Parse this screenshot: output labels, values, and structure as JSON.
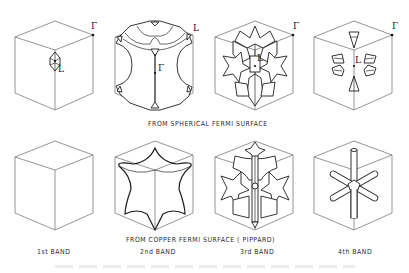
{
  "figure": {
    "rows": [
      {
        "id": "spherical",
        "caption": "FROM SPHERICAL FERMI SURFACE",
        "panels": [
          {
            "band": "1st",
            "shape": "small lens pocket at L",
            "point_labels": [
              "Γ",
              "L"
            ]
          },
          {
            "band": "2nd",
            "shape": "large surface with necks toward L",
            "point_labels": [
              "L",
              "Γ"
            ]
          },
          {
            "band": "3rd",
            "shape": "complex multi-lobed surface",
            "point_labels": [
              "Γ",
              "L"
            ]
          },
          {
            "band": "4th",
            "shape": "six small pockets around L",
            "point_labels": [
              "Γ",
              "L"
            ]
          }
        ]
      },
      {
        "id": "copper",
        "caption": "FROM COPPER FERMI SURFACE ( PIPPARD)",
        "panels": [
          {
            "band": "1st",
            "shape": "empty zone"
          },
          {
            "band": "2nd",
            "shape": "six-pointed star surface"
          },
          {
            "band": "3rd",
            "shape": "multi-lobed surface"
          },
          {
            "band": "4th",
            "shape": "six-armed tubular network"
          }
        ]
      }
    ],
    "band_labels": [
      "1st BAND",
      "2nd BAND",
      "3rd BAND",
      "4th BAND"
    ],
    "symbols": {
      "gamma": "Γ",
      "L": "L"
    },
    "colors": {
      "line": "#1e1e1e",
      "cube_edge": "#7a7a7a",
      "background": "#ffffff"
    }
  }
}
